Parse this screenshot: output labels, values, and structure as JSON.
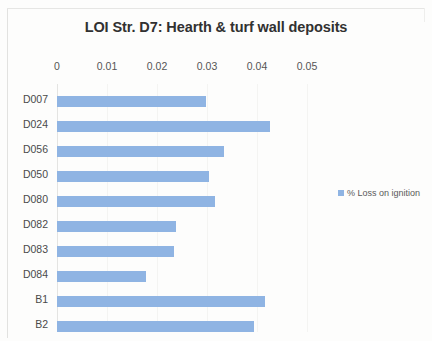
{
  "chart_data": {
    "type": "bar",
    "orientation": "horizontal",
    "title": "LOI Str. D7: Hearth & turf wall deposits",
    "xlabel": "",
    "ylabel": "",
    "categories": [
      "D007",
      "D024",
      "D056",
      "D050",
      "D080",
      "D082",
      "D083",
      "D084",
      "B1",
      "B2"
    ],
    "values": [
      0.0298,
      0.0426,
      0.0334,
      0.0304,
      0.0316,
      0.0238,
      0.0234,
      0.0178,
      0.0416,
      0.0394
    ],
    "series": [
      {
        "name": "% Loss on ignition",
        "values": [
          0.0298,
          0.0426,
          0.0334,
          0.0304,
          0.0316,
          0.0238,
          0.0234,
          0.0178,
          0.0416,
          0.0394
        ]
      }
    ],
    "xlim": [
      0,
      0.05
    ],
    "xticks": [
      0,
      0.01,
      0.02,
      0.03,
      0.04,
      0.05
    ],
    "xtick_labels": [
      "0",
      "0.01",
      "0.02",
      "0.03",
      "0.04",
      "0.05"
    ],
    "grid": true,
    "legend_position": "right",
    "bar_color": "#8fb4e3"
  },
  "legend": {
    "entries": [
      {
        "label": "% Loss on ignition",
        "color": "#8fb4e3"
      }
    ]
  }
}
